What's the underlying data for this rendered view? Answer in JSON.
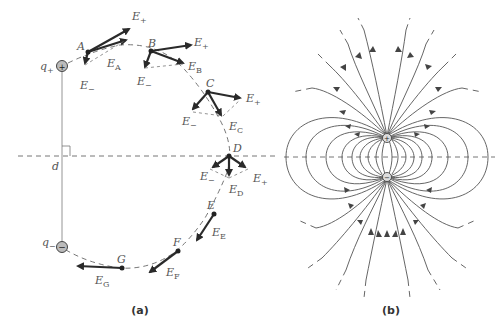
{
  "panels": [
    {
      "id": "a",
      "caption": "(a)",
      "charges": {
        "positive_label": "q+",
        "negative_label": "q−",
        "separation_label": "d"
      },
      "points": [
        {
          "name": "A",
          "field_label": "E",
          "field_sub": "A"
        },
        {
          "name": "B",
          "field_label": "E",
          "field_sub": "B"
        },
        {
          "name": "C",
          "field_label": "E",
          "field_sub": "C"
        },
        {
          "name": "D",
          "field_label": "E",
          "field_sub": "D"
        },
        {
          "name": "E",
          "field_label": "E",
          "field_sub": "E"
        },
        {
          "name": "F",
          "field_label": "E",
          "field_sub": "F"
        },
        {
          "name": "G",
          "field_label": "E",
          "field_sub": "G"
        }
      ],
      "component_labels": {
        "plus": "E₊",
        "minus": "E₋"
      }
    },
    {
      "id": "b",
      "caption": "(b)",
      "description": "Electric field lines of a dipole"
    }
  ],
  "colors": {
    "vector": "#2a2a2a",
    "line": "#555555",
    "charge_fill": "#bbbbbb"
  }
}
